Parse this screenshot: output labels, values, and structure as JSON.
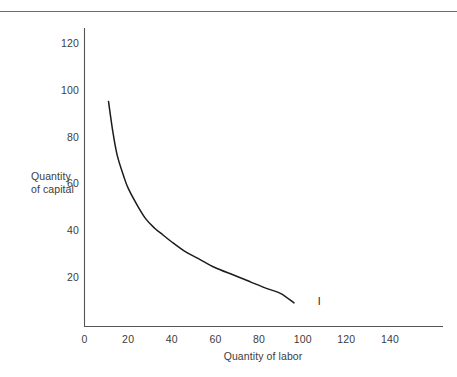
{
  "figure": {
    "background_color": "#ffffff",
    "rule_color": "#6d6d6d",
    "axis_color": "#555555",
    "curve_color": "#1b1b1b",
    "text_color": "#3c3c3c"
  },
  "chart_data": {
    "type": "line",
    "title": "",
    "subtitle": "",
    "xlabel": "Quantity of labor",
    "ylabel_lines": [
      "Quantity",
      "of capital"
    ],
    "ylabel": "Quantity of capital",
    "xlim": [
      0,
      160
    ],
    "ylim": [
      0,
      130
    ],
    "xticks": [
      0,
      20,
      40,
      60,
      80,
      100,
      120,
      140
    ],
    "yticks": [
      20,
      40,
      60,
      80,
      100,
      120
    ],
    "xtick_labels": [
      "0",
      "20",
      "40",
      "60",
      "80",
      "100",
      "120",
      "140"
    ],
    "ytick_labels": [
      "20",
      "40",
      "60",
      "80",
      "100",
      "120"
    ],
    "grid": false,
    "legend": "none",
    "annotations": [
      {
        "text": "I",
        "meaning": "isoquant-label",
        "x": 106,
        "y": 10
      }
    ],
    "series": [
      {
        "name": "I",
        "description": "isoquant (constant output curve)",
        "x": [
          11,
          13,
          15,
          18,
          20,
          24,
          28,
          32,
          36,
          40,
          46,
          52,
          60,
          68,
          76,
          84,
          90,
          96
        ],
        "y": [
          95,
          82,
          72,
          63,
          58,
          51,
          45,
          41,
          38,
          35,
          31,
          28,
          24,
          21,
          18,
          15,
          13,
          9
        ]
      }
    ]
  }
}
